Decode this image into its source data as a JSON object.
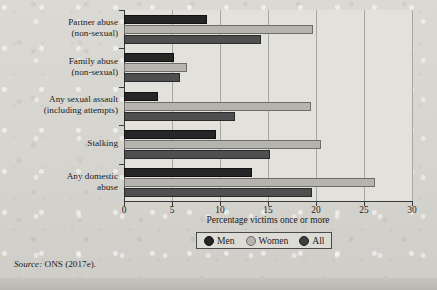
{
  "chart_data": {
    "type": "bar",
    "orientation": "horizontal",
    "title": "",
    "xlabel": "Percentage victims once or more",
    "ylabel": "",
    "xlim": [
      0,
      30
    ],
    "xticks": [
      0,
      5,
      10,
      15,
      20,
      25,
      30
    ],
    "xticklabels": [
      "0",
      "5",
      "10",
      "15",
      "20",
      "25",
      "30"
    ],
    "grid": "vertical",
    "legend_position": "below-axis",
    "categories": [
      "Partner abuse\n(non-sexual)",
      "Family abuse\n(non-sexual)",
      "Any sexual assault\n(including attempts)",
      "Stalking",
      "Any domestic\nabuse"
    ],
    "category_lines": [
      [
        "Partner abuse",
        "(non-sexual)"
      ],
      [
        "Family abuse",
        "(non-sexual)"
      ],
      [
        "Any sexual assault",
        "(including attempts)"
      ],
      [
        "Stalking"
      ],
      [
        "Any domestic",
        "abuse"
      ]
    ],
    "series": [
      {
        "name": "Men",
        "color": "#262626",
        "values": [
          8.6,
          5.2,
          3.5,
          9.6,
          13.3
        ]
      },
      {
        "name": "Women",
        "color": "#b6b4af",
        "values": [
          19.7,
          6.6,
          19.5,
          20.5,
          26.1
        ]
      },
      {
        "name": "All",
        "color": "#4f4f4f",
        "values": [
          14.3,
          5.8,
          11.6,
          15.2,
          19.6
        ]
      }
    ]
  },
  "legend": {
    "items": [
      {
        "label": "Men",
        "key": "men"
      },
      {
        "label": "Women",
        "key": "women"
      },
      {
        "label": "All",
        "key": "all"
      }
    ]
  },
  "source": {
    "label": "Source:",
    "text": "ONS (2017e)."
  }
}
